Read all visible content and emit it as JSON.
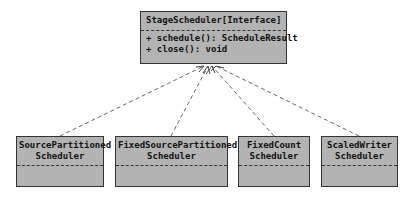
{
  "diagram": {
    "type": "uml-class-diagram",
    "interface": {
      "name": "StageScheduler[Interface]",
      "operations": [
        "+ schedule(): ScheduleResult",
        "+ close(): void"
      ]
    },
    "implementations": [
      {
        "name_line1": "SourcePartitioned",
        "name_line2": "Scheduler"
      },
      {
        "name_line1": "FixedSourcePartitioned",
        "name_line2": "Scheduler"
      },
      {
        "name_line1": "FixedCount",
        "name_line2": "Scheduler"
      },
      {
        "name_line1": "ScaledWriter",
        "name_line2": "Scheduler"
      }
    ],
    "relationship": "realization (dashed arrow to interface)",
    "colors": {
      "box_fill": "#b3b3b3",
      "border": "#333333",
      "arrow": "#666666"
    }
  }
}
